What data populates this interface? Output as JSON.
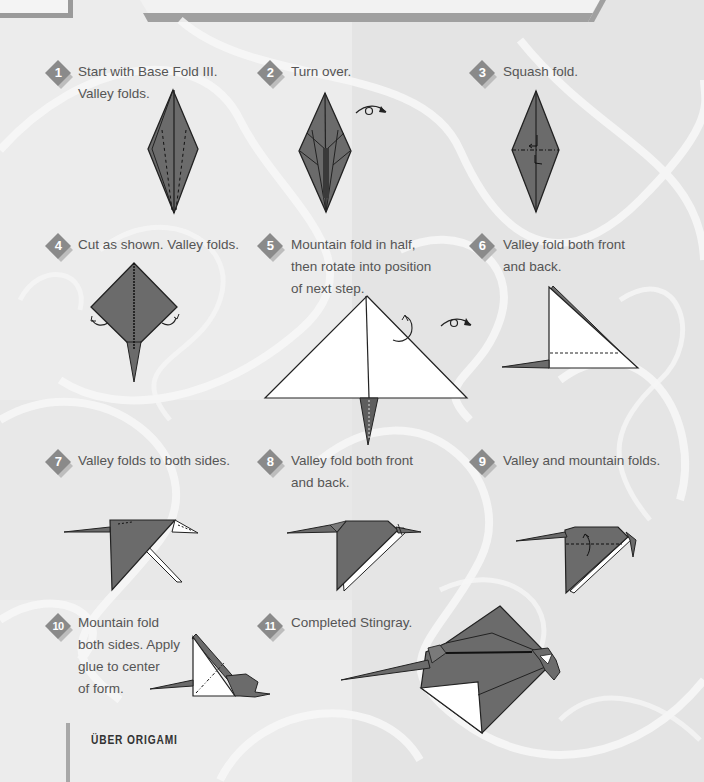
{
  "page": {
    "footer_title": "ÜBER ORIGAMI",
    "colors": {
      "background": "#ececec",
      "paper_dark": "#6b6b6b",
      "paper_light": "#ffffff",
      "badge": "#8a8a8a",
      "text": "#555555"
    }
  },
  "steps": [
    {
      "number": "1",
      "lines": [
        "Start with Base Fold III.",
        "Valley folds."
      ]
    },
    {
      "number": "2",
      "lines": [
        "Turn over."
      ]
    },
    {
      "number": "3",
      "lines": [
        "Squash fold."
      ]
    },
    {
      "number": "4",
      "lines": [
        "Cut as shown. Valley folds."
      ]
    },
    {
      "number": "5",
      "lines": [
        "Mountain fold in half,",
        "then rotate into position",
        "of next step."
      ]
    },
    {
      "number": "6",
      "lines": [
        "Valley fold both front",
        "and back."
      ]
    },
    {
      "number": "7",
      "lines": [
        "Valley folds to both sides."
      ]
    },
    {
      "number": "8",
      "lines": [
        "Valley fold both front",
        "and back."
      ]
    },
    {
      "number": "9",
      "lines": [
        "Valley and mountain folds."
      ]
    },
    {
      "number": "10",
      "lines": [
        "Mountain fold",
        "both sides. Apply",
        "glue to center",
        "of form."
      ]
    },
    {
      "number": "11",
      "lines": [
        "Completed Stingray."
      ]
    }
  ]
}
